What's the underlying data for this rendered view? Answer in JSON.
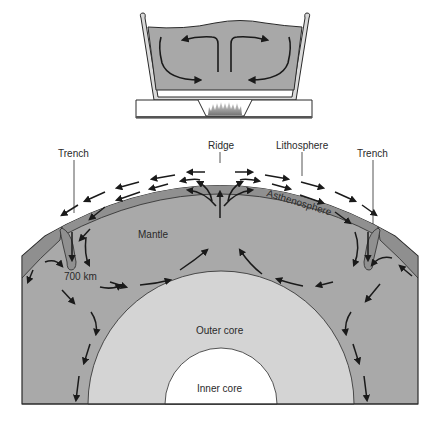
{
  "figure": {
    "top_panel": {
      "description": "Convection in a heated pot",
      "elements": [
        "pot",
        "liquid",
        "convection-arrows",
        "stove",
        "flame"
      ]
    },
    "bottom_panel": {
      "description": "Mantle convection in Earth cross-section",
      "labels": {
        "ridge": "Ridge",
        "lithosphere": "Lithosphere",
        "trench_left": "Trench",
        "trench_right": "Trench",
        "asthenosphere": "Asthenosphere",
        "mantle": "Mantle",
        "depth": "700 km",
        "outer_core": "Outer core",
        "inner_core": "Inner core"
      }
    },
    "colors": {
      "mantle": "#a9a9a9",
      "lithosphere": "#8f8f8f",
      "outer_core": "#d4d4d4",
      "inner_core": "#ffffff",
      "pot_liquid": "#a8a8a8",
      "pot_wall": "#d8d8d8",
      "stroke": "#2a2a2a"
    }
  }
}
